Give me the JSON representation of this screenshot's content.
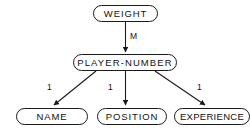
{
  "diagram": {
    "type": "data-structure-diagram",
    "background_color": "#ffffff",
    "line_color": "#1a1a1a",
    "text_color": "#111111",
    "nodes": [
      {
        "id": "weight",
        "label": "WEIGHT"
      },
      {
        "id": "player-number",
        "label": "PLAYER-NUMBER"
      },
      {
        "id": "name",
        "label": "NAME"
      },
      {
        "id": "position",
        "label": "POSITION"
      },
      {
        "id": "experience",
        "label": "EXPERIENCE"
      }
    ],
    "edges": [
      {
        "id": "weight-to-player-number",
        "from": "weight",
        "to": "player-number",
        "label": "M"
      },
      {
        "id": "player-number-to-name",
        "from": "player-number",
        "to": "name",
        "label": "1"
      },
      {
        "id": "player-number-to-position",
        "from": "player-number",
        "to": "position",
        "label": "1"
      },
      {
        "id": "player-number-to-experience",
        "from": "player-number",
        "to": "experience",
        "label": "1"
      }
    ]
  }
}
